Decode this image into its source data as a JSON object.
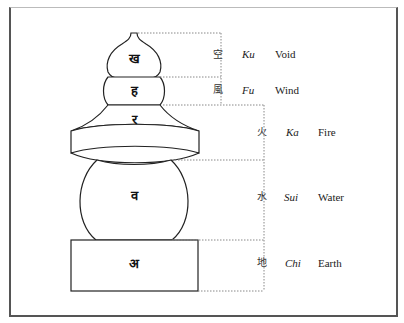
{
  "diagram": {
    "elements": [
      {
        "id": "void",
        "kanji": "空",
        "romaji": "Ku",
        "english": "Void",
        "shape": "gourd / jewel",
        "seed": "ख"
      },
      {
        "id": "wind",
        "kanji": "風",
        "romaji": "Fu",
        "english": "Wind",
        "shape": "half-moon",
        "seed": "ह"
      },
      {
        "id": "fire",
        "kanji": "火",
        "romaji": "Ka",
        "english": "Fire",
        "shape": "triangle / roof",
        "seed": "र"
      },
      {
        "id": "water",
        "kanji": "水",
        "romaji": "Sui",
        "english": "Water",
        "shape": "sphere",
        "seed": "व"
      },
      {
        "id": "earth",
        "kanji": "地",
        "romaji": "Chi",
        "english": "Earth",
        "shape": "cube",
        "seed": "अ"
      }
    ]
  },
  "colors": {
    "ink": "#222222",
    "dotted": "#888888",
    "background": "#ffffff"
  }
}
